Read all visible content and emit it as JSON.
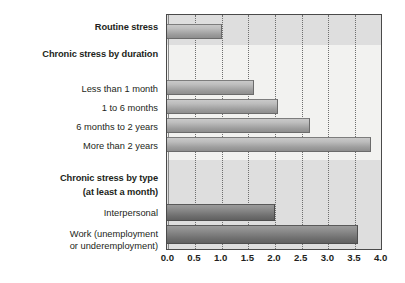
{
  "chart_data": {
    "type": "bar",
    "orientation": "horizontal",
    "title": "",
    "xlabel": "",
    "ylabel": "",
    "xlim": [
      0.0,
      4.0
    ],
    "xticks": [
      "0.0",
      "0.5",
      "1.0",
      "1.5",
      "2.0",
      "2.5",
      "3.0",
      "3.5",
      "4.0"
    ],
    "xtick_values": [
      0.0,
      0.5,
      1.0,
      1.5,
      2.0,
      2.5,
      3.0,
      3.5,
      4.0
    ],
    "grid": "vertical dotted gridlines at every 0.5 tick",
    "legend": "none",
    "categories": [
      "Routine stress",
      "Less than 1 month",
      "1 to 6 months",
      "6 months to 2 years",
      "More than 2 years",
      "Interpersonal",
      "Work (unemployment or underemployment)"
    ],
    "values": [
      1.0,
      1.6,
      2.05,
      2.65,
      3.8,
      2.0,
      3.55
    ],
    "groups": [
      {
        "header": "",
        "header_bold": false,
        "items": [
          {
            "label": "Routine stress",
            "value": 1.0,
            "bold": true,
            "shade": "light"
          }
        ]
      },
      {
        "header": "Chronic stress by duration",
        "header_bold": true,
        "items": [
          {
            "label": "Less than 1 month",
            "value": 1.6,
            "bold": false,
            "shade": "light"
          },
          {
            "label": "1 to 6 months",
            "value": 2.05,
            "bold": false,
            "shade": "light"
          },
          {
            "label": "6 months to 2 years",
            "value": 2.65,
            "bold": false,
            "shade": "light"
          },
          {
            "label": "More than 2 years",
            "value": 3.8,
            "bold": false,
            "shade": "light"
          }
        ]
      },
      {
        "header": "Chronic stress by type (at least a month)",
        "header_bold": true,
        "items": [
          {
            "label": "Interpersonal",
            "value": 2.0,
            "bold": false,
            "shade": "dark"
          },
          {
            "label": "Work (unemployment or underemployment)",
            "value": 3.55,
            "bold": false,
            "shade": "dark"
          }
        ]
      }
    ]
  },
  "labels": {
    "routine_stress": "Routine stress",
    "chronic_by_duration": "Chronic stress by duration",
    "less_than_1_month": "Less than 1 month",
    "one_to_6_months": "1 to 6 months",
    "six_months_to_2_years": "6 months to 2 years",
    "more_than_2_years": "More than 2 years",
    "chronic_by_type_line1": "Chronic stress by type",
    "chronic_by_type_line2": "(at least a month)",
    "interpersonal": "Interpersonal",
    "work_line1": "Work (unemployment",
    "work_line2": "or underemployment)"
  },
  "axis": {
    "ticks": [
      "0.0",
      "0.5",
      "1.0",
      "1.5",
      "2.0",
      "2.5",
      "3.0",
      "3.5",
      "4.0"
    ]
  },
  "colors": {
    "plot_background": "#f2f2f0",
    "band_shaded": "#dedede",
    "bar_light": "#bdbdbd",
    "bar_dark": "#8d8d8d",
    "text": "#231f20",
    "border": "#4a4a4a",
    "gridline": "#6e6e6e"
  }
}
